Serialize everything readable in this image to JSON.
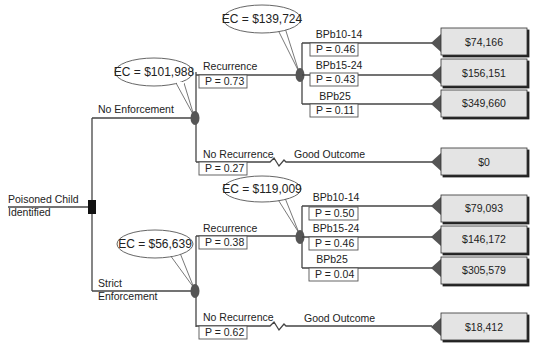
{
  "diagram": {
    "type": "decision-tree",
    "root": {
      "label_line1": "Poisoned Child",
      "label_line2": "Identified",
      "node_type": "decision"
    },
    "branches": [
      {
        "label": "No Enforcement",
        "ec": "EC = $101,988",
        "recurrence": {
          "label": "Recurrence",
          "p": "P = 0.73",
          "ec": "EC = $139,724",
          "outcomes": [
            {
              "label": "BPb10-14",
              "p": "P = 0.46",
              "payoff": "$74,166"
            },
            {
              "label": "BPb15-24",
              "p": "P = 0.43",
              "payoff": "$156,151"
            },
            {
              "label": "BPb25",
              "p": "P = 0.11",
              "payoff": "$349,660"
            }
          ]
        },
        "no_recurrence": {
          "label": "No Recurrence",
          "p": "P = 0.27",
          "outcome_label": "Good Outcome",
          "payoff": "$0"
        }
      },
      {
        "label_line1": "Strict",
        "label_line2": "Enforcement",
        "ec": "EC = $56,639",
        "recurrence": {
          "label": "Recurrence",
          "p": "P = 0.38",
          "ec": "EC = $119,009",
          "outcomes": [
            {
              "label": "BPb10-14",
              "p": "P = 0.50",
              "payoff": "$79,093"
            },
            {
              "label": "BPb15-24",
              "p": "P = 0.46",
              "payoff": "$146,172"
            },
            {
              "label": "BPb25",
              "p": "P = 0.04",
              "payoff": "$305,579"
            }
          ]
        },
        "no_recurrence": {
          "label": "No Recurrence",
          "p": "P = 0.62",
          "outcome_label": "Good Outcome",
          "payoff": "$18,412"
        }
      }
    ],
    "colors": {
      "line": "#444444",
      "node": "#555555",
      "decision_node": "#111111",
      "payoff_box": "#e4e4e4",
      "payoff_border": "#333333"
    }
  }
}
